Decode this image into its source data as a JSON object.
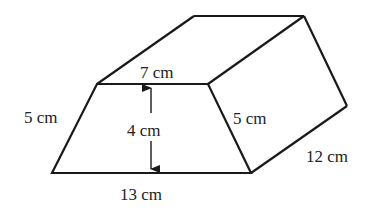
{
  "figure": {
    "type": "trapezoidal-prism",
    "stroke_color": "#1a1a1a",
    "text_color": "#222222",
    "labels": {
      "top_width": "7 cm",
      "left_slant": "5 cm",
      "height": "4 cm",
      "right_slant": "5 cm",
      "base_width": "13 cm",
      "depth": "12 cm"
    }
  }
}
